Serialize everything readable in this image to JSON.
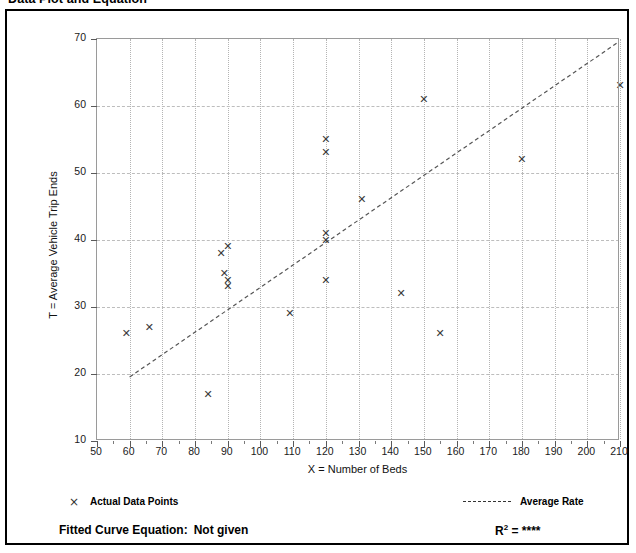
{
  "page": {
    "title": "Data Plot and Equation"
  },
  "axes": {
    "x_title": "X = Number of Beds",
    "y_title": "T = Average Vehicle Trip Ends",
    "x_ticks": [
      50,
      60,
      70,
      80,
      90,
      100,
      110,
      120,
      130,
      140,
      150,
      160,
      170,
      180,
      190,
      200,
      210
    ],
    "y_ticks": [
      10,
      20,
      30,
      40,
      50,
      60,
      70
    ]
  },
  "legend": {
    "points_marker": "×",
    "points_label": "Actual Data Points",
    "rate_label": "Average Rate",
    "rate_style": "dashed"
  },
  "equation": {
    "label": "Fitted Curve Equation:",
    "value": "Not given",
    "r2_prefix": "R",
    "r2_exponent": "2",
    "r2_equals": "=",
    "r2_value": "****"
  },
  "chart_data": {
    "type": "scatter",
    "title": "Data Plot and Equation",
    "xlabel": "X = Number of Beds",
    "ylabel": "T = Average Vehicle Trip Ends",
    "xlim": [
      50,
      210
    ],
    "ylim": [
      10,
      70
    ],
    "grid": true,
    "legend_position": "below-plot",
    "series": [
      {
        "name": "Actual Data Points",
        "marker": "x",
        "color": "#3a3a3a",
        "points": [
          {
            "x": 59,
            "y": 26
          },
          {
            "x": 66,
            "y": 27
          },
          {
            "x": 84,
            "y": 17
          },
          {
            "x": 88,
            "y": 38
          },
          {
            "x": 90,
            "y": 39
          },
          {
            "x": 89,
            "y": 35
          },
          {
            "x": 90,
            "y": 34
          },
          {
            "x": 90,
            "y": 33
          },
          {
            "x": 109,
            "y": 29
          },
          {
            "x": 120,
            "y": 55
          },
          {
            "x": 120,
            "y": 53
          },
          {
            "x": 120,
            "y": 41
          },
          {
            "x": 120,
            "y": 40
          },
          {
            "x": 120,
            "y": 34
          },
          {
            "x": 131,
            "y": 46
          },
          {
            "x": 143,
            "y": 32
          },
          {
            "x": 150,
            "y": 61
          },
          {
            "x": 155,
            "y": 26
          },
          {
            "x": 180,
            "y": 52
          },
          {
            "x": 210,
            "y": 63
          }
        ]
      }
    ],
    "trend_line": {
      "name": "Average Rate",
      "style": "dashed",
      "color": "#555555",
      "x0": 60,
      "y0": 19.3,
      "x1": 210,
      "y1": 69.6
    }
  }
}
